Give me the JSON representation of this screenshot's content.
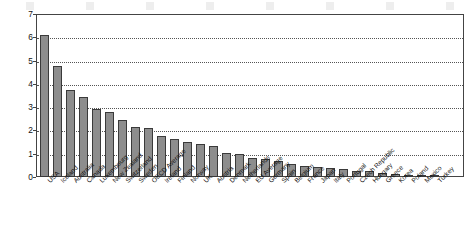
{
  "chart_data": {
    "type": "bar",
    "title": "",
    "subtitle": "",
    "xlabel": "",
    "ylabel": "Number per capita",
    "ylim": [
      0,
      7
    ],
    "yticks": [
      0,
      1,
      2,
      3,
      4,
      5,
      6,
      7
    ],
    "ytick_labels": [
      "0",
      "1",
      "2",
      "3",
      "4",
      "5",
      "6",
      "7"
    ],
    "grid": true,
    "grid_axis": "y",
    "legend": false,
    "legend_position": "none",
    "bar_color": "#8d8d8d",
    "bar_edge_color": "#3a3a3a",
    "categories": [
      "USA",
      "Iceland",
      "Australia",
      "Canada",
      "Luxembourg",
      "New Zealand",
      "Switzerland",
      "Sweden",
      "OECD Average",
      "Ireland",
      "Finland",
      "Norway",
      "UK",
      "Austria",
      "Denmark",
      "Netherlands",
      "EU Average",
      "Germany",
      "Spain",
      "Belgium",
      "France",
      "Japan",
      "Italy",
      "Portugal",
      "Czech Republic",
      "Hungary",
      "Greece",
      "Korea",
      "Poland",
      "Mexico",
      "Turkey"
    ],
    "values": [
      6.1,
      4.75,
      3.75,
      3.45,
      2.9,
      2.8,
      2.45,
      2.15,
      2.1,
      1.75,
      1.62,
      1.52,
      1.42,
      1.33,
      1.05,
      1.0,
      0.82,
      0.76,
      0.7,
      0.55,
      0.49,
      0.45,
      0.39,
      0.33,
      0.27,
      0.24,
      0.17,
      0.13,
      0.06,
      0.04,
      0.03
    ]
  }
}
